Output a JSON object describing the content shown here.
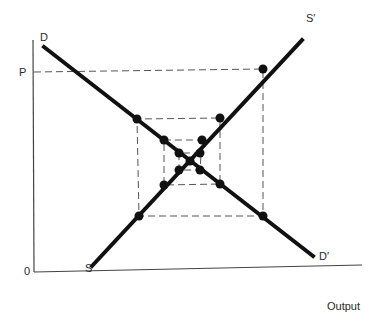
{
  "diagram": {
    "labels": {
      "demand_start": "D",
      "demand_end": "D′",
      "supply_start": "S",
      "supply_end": "S′",
      "price": "P",
      "origin": "0",
      "x_axis": "Output"
    },
    "colors": {
      "line": "#111111",
      "dash": "#555555",
      "axis": "#444444"
    }
  }
}
